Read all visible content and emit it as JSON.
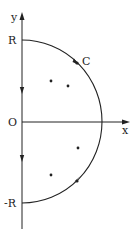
{
  "diagram": {
    "type": "contour-integral",
    "labels": {
      "y_axis": "y",
      "x_axis": "x",
      "origin": "O",
      "top": "R",
      "bottom": "-R",
      "contour": "C"
    },
    "colors": {
      "stroke": "#222222",
      "background": "#ffffff"
    },
    "points": [
      {
        "x": 51,
        "y": 81
      },
      {
        "x": 68,
        "y": 86
      },
      {
        "x": 78,
        "y": 148
      },
      {
        "x": 51,
        "y": 175
      }
    ]
  }
}
